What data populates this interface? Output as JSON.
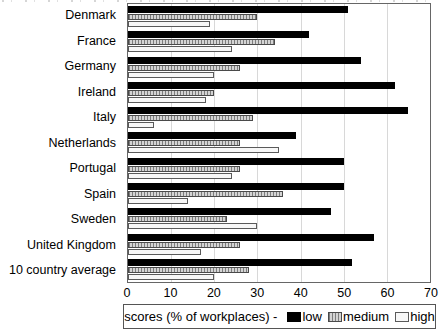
{
  "chart_data": {
    "type": "bar",
    "orientation": "horizontal",
    "title": "",
    "xlabel": "scores (% of workplaces)",
    "ylabel": "",
    "xlim": [
      0,
      70
    ],
    "xticks": [
      0,
      10,
      20,
      30,
      40,
      50,
      60,
      70
    ],
    "grid": "vertical",
    "legend_position": "bottom",
    "categories": [
      "Denmark",
      "France",
      "Germany",
      "Ireland",
      "Italy",
      "Netherlands",
      "Portugal",
      "Spain",
      "Sweden",
      "United Kingdom",
      "10 country average"
    ],
    "series": [
      {
        "name": "low",
        "color": "#000000",
        "pattern": "solid",
        "values": [
          51,
          42,
          54,
          62,
          65,
          39,
          50,
          50,
          47,
          57,
          52
        ]
      },
      {
        "name": "medium",
        "color": "#c8c8c8",
        "pattern": "vertical-hatch",
        "values": [
          30,
          34,
          26,
          20,
          29,
          26,
          26,
          36,
          23,
          26,
          28
        ]
      },
      {
        "name": "high",
        "color": "#ffffff",
        "pattern": "outline",
        "values": [
          19,
          24,
          20,
          18,
          6,
          35,
          24,
          14,
          30,
          17,
          20
        ]
      }
    ]
  },
  "legend": {
    "prefix": "scores (% of workplaces) -"
  }
}
